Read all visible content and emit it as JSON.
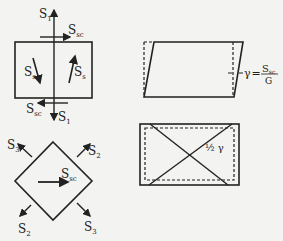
{
  "figure": {
    "top_left": {
      "title": "Pure shear element",
      "labels": {
        "s1_top": "S",
        "s1_top_sub": "1",
        "ssc_top": "S",
        "ssc_top_sub": "sc",
        "ss_left": "S",
        "ss_left_sub": "s",
        "ss_right": "S",
        "ss_right_sub": "s",
        "ssc_bottom": "S",
        "ssc_bottom_sub": "sc",
        "s1_bottom": "S",
        "s1_bottom_sub": "1"
      }
    },
    "bottom_left": {
      "title": "Rotated element (45°)",
      "labels": {
        "s3_tl": "S",
        "s3_tl_sub": "3",
        "s2_tr": "S",
        "s2_tr_sub": "2",
        "ssc_center": "S",
        "ssc_center_sub": "sc",
        "s2_bl": "S",
        "s2_bl_sub": "2",
        "s3_br": "S",
        "s3_br_sub": "3"
      }
    },
    "top_right": {
      "title": "Shear deformation",
      "gamma": "γ",
      "equals": "=",
      "numerator": "S",
      "numerator_sub": "sc",
      "denominator": "G"
    },
    "bottom_right": {
      "title": "Diagonal strain",
      "label": "½ γ"
    }
  }
}
